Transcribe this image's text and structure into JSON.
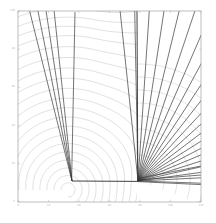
{
  "figure": {
    "kind": "contour-ray-plot",
    "background": "#ffffff",
    "frame_color": "#a0a0a0",
    "contour_color": "#b4b4b4",
    "ray_color": "#3a3a3a",
    "interface_color": "#2b2b2b",
    "tick_label_color": "#b9b9b9"
  },
  "chart_data": {
    "type": "line",
    "title": "",
    "subtitle": "",
    "xlabel": "",
    "ylabel": "",
    "grid": false,
    "legend": null,
    "xlim": [
      0,
      120
    ],
    "ylim": [
      0,
      100
    ],
    "xticks": [
      0,
      20,
      40,
      60,
      80,
      100,
      120
    ],
    "yticks": [
      0,
      20,
      40,
      60,
      80,
      100
    ],
    "xtick_labels": [
      "0",
      "20",
      "40",
      "60",
      "80",
      "100",
      "120"
    ],
    "ytick_labels": [
      "0",
      "20",
      "40",
      "60",
      "80",
      "100"
    ],
    "source_point": {
      "x": 68,
      "y": 190,
      "label": "source"
    },
    "interface_x_px": 137,
    "right_fan": {
      "apex_px": {
        "x": 138,
        "y": 181
      },
      "n_rays": 21,
      "angle_start_deg": -96,
      "angle_end_deg": 2,
      "label": "refracted ray fan"
    },
    "left_fan": {
      "apex_px": {
        "x": 72,
        "y": 181
      },
      "n_rays": 4,
      "angle_start_deg": -104,
      "angle_end_deg": -96,
      "label": "upgoing ray bundle"
    },
    "contours": {
      "n_levels": 26,
      "center_px": {
        "x": 68,
        "y": 190
      },
      "spacing_px": 7.0,
      "label": "traveltime isochrons"
    },
    "right_arcs": {
      "n_levels": 9,
      "center_px": {
        "x": 138,
        "y": 181
      },
      "spacing_px": 13.0,
      "label": "secondary wavefronts"
    }
  },
  "axes": {
    "frame_px": {
      "left": 18,
      "top": 11,
      "right": 201,
      "bottom": 202
    }
  }
}
